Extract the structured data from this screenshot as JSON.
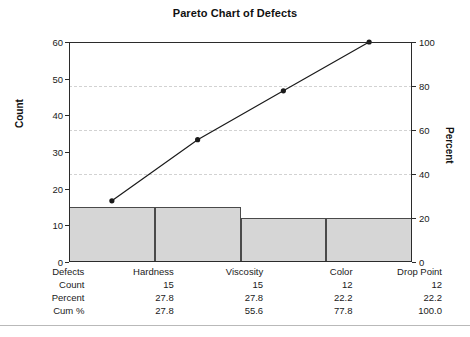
{
  "chart": {
    "title": "Pareto Chart of Defects",
    "axis_left_title": "Count",
    "axis_right_title": "Percent"
  },
  "table": {
    "rows": [
      {
        "label": "Defects",
        "values": [
          "Hardness",
          "Viscosity",
          "Color",
          "Drop Point"
        ]
      },
      {
        "label": "Count",
        "values": [
          "15",
          "15",
          "12",
          "12"
        ]
      },
      {
        "label": "Percent",
        "values": [
          "27.8",
          "27.8",
          "22.2",
          "22.2"
        ]
      },
      {
        "label": "Cum %",
        "values": [
          "27.8",
          "55.6",
          "77.8",
          "100.0"
        ]
      }
    ]
  },
  "axis_left": {
    "ticks": [
      "0",
      "10",
      "20",
      "30",
      "40",
      "50",
      "60"
    ]
  },
  "axis_right": {
    "ticks": [
      "0",
      "20",
      "40",
      "60",
      "80",
      "100"
    ]
  },
  "colors": {
    "bar_fill": "#d6d6d6",
    "bar_border": "#4a4a4a",
    "axis": "#2b2b2b",
    "gridline": "#d2d2d2",
    "line": "#1a1a1a"
  },
  "chart_data": {
    "type": "bar",
    "title": "Pareto Chart of Defects",
    "xlabel": "Defects",
    "ylabel": "Count",
    "y2label": "Percent",
    "categories": [
      "Hardness",
      "Viscosity",
      "Color",
      "Drop Point"
    ],
    "values": [
      15,
      15,
      12,
      12
    ],
    "ylim": [
      0,
      60
    ],
    "y2lim": [
      0,
      100
    ],
    "yticks": [
      0,
      10,
      20,
      30,
      40,
      50,
      60
    ],
    "y2ticks": [
      0,
      20,
      40,
      60,
      80,
      100
    ],
    "grid": true,
    "legend": "none",
    "series": [
      {
        "name": "Count",
        "type": "bar",
        "values": [
          15,
          15,
          12,
          12
        ],
        "axis": "left"
      },
      {
        "name": "Cum %",
        "type": "line",
        "values": [
          27.8,
          55.6,
          77.8,
          100.0
        ],
        "axis": "right"
      }
    ],
    "percent": [
      27.8,
      27.8,
      22.2,
      22.2
    ],
    "cumulative_percent": [
      27.8,
      55.6,
      77.8,
      100.0
    ],
    "total_count": 54
  }
}
